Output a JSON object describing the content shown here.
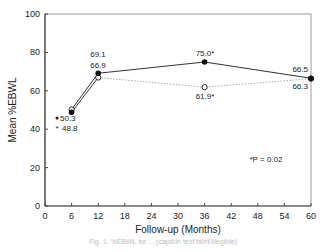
{
  "chart_data": {
    "type": "line",
    "title": "",
    "xlabel": "Follow-up (Months)",
    "ylabel": "Mean %EBWL",
    "xlim": [
      0,
      60
    ],
    "ylim": [
      0,
      100
    ],
    "xticks": [
      0,
      6,
      12,
      18,
      24,
      30,
      36,
      42,
      48,
      54,
      60
    ],
    "yticks": [
      0,
      20,
      40,
      60,
      80,
      100
    ],
    "grid": false,
    "series": [
      {
        "name": "Filled circles (solid line)",
        "marker": "filled-circle",
        "line": "solid",
        "points": [
          {
            "x": 6,
            "y": 48.8,
            "label": "48.8"
          },
          {
            "x": 12,
            "y": 69.1,
            "label": "69.1"
          },
          {
            "x": 36,
            "y": 75.0,
            "label": "75.0*"
          },
          {
            "x": 60,
            "y": 66.5,
            "label": "66.5"
          }
        ]
      },
      {
        "name": "Open circles (dotted line)",
        "marker": "open-circle",
        "line": "dotted",
        "points": [
          {
            "x": 6,
            "y": 50.3,
            "label": "50.3"
          },
          {
            "x": 12,
            "y": 66.9,
            "label": "66.9"
          },
          {
            "x": 36,
            "y": 61.9,
            "label": "61.9*"
          },
          {
            "x": 60,
            "y": 66.3,
            "label": "66.3"
          }
        ]
      }
    ],
    "legend_markers": [
      {
        "marker": "filled-circle",
        "label": "50.3"
      },
      {
        "marker": "open-circle",
        "label": "48.8"
      }
    ],
    "annotation": "*P = 0.02"
  },
  "caption": "Fig. 1. %EBWL for ... (caption text faint/illegible)"
}
